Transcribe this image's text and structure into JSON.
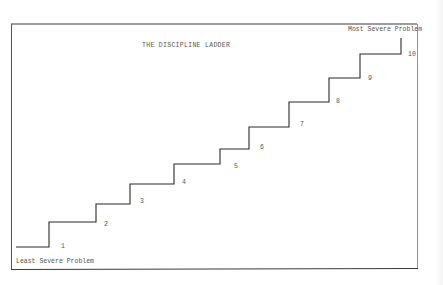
{
  "diagram": {
    "title": "THE DISCIPLINE LADDER",
    "top_label": "Most Severe Problem",
    "bottom_label": "Least Severe Problem",
    "steps": [
      {
        "label": "1",
        "x1": 16,
        "x2": 49,
        "y": 247,
        "label_x": 61,
        "label_y": 246
      },
      {
        "label": "2",
        "x1": 49,
        "x2": 96,
        "y": 222,
        "label_x": 104,
        "label_y": 224
      },
      {
        "label": "3",
        "x1": 96,
        "x2": 130,
        "y": 204,
        "label_x": 140,
        "label_y": 201
      },
      {
        "label": "4",
        "x1": 130,
        "x2": 174,
        "y": 184,
        "label_x": 182,
        "label_y": 182
      },
      {
        "label": "5",
        "x1": 174,
        "x2": 220,
        "y": 164,
        "label_x": 234,
        "label_y": 166
      },
      {
        "label": "6",
        "x1": 220,
        "x2": 249,
        "y": 149,
        "label_x": 260,
        "label_y": 147
      },
      {
        "label": "7",
        "x1": 249,
        "x2": 289,
        "y": 127,
        "label_x": 300,
        "label_y": 124
      },
      {
        "label": "8",
        "x1": 289,
        "x2": 329,
        "y": 102,
        "label_x": 336,
        "label_y": 101
      },
      {
        "label": "9",
        "x1": 329,
        "x2": 360,
        "y": 78,
        "label_x": 368,
        "label_y": 78
      },
      {
        "label": "10",
        "x1": 360,
        "x2": 401,
        "y": 54,
        "label_x": 408,
        "label_y": 54
      }
    ],
    "top_y": 38,
    "colors": {
      "line": "#2a2a2a",
      "border": "#3a3a3a",
      "text": "#555555"
    }
  }
}
